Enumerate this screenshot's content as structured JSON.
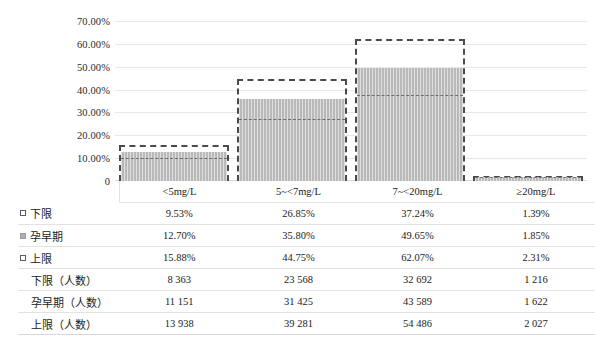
{
  "chart_data": {
    "type": "bar",
    "title": "",
    "xlabel": "",
    "ylabel": "",
    "ylim": [
      0,
      0.7
    ],
    "grid": true,
    "legend_position": "row-labels-left",
    "categories": [
      "<5mg/L",
      "5~<7mg/L",
      "7~<20mg/L",
      "≥20mg/L"
    ],
    "ytick_labels": [
      "70.00%",
      "60.00%",
      "50.00%",
      "40.00%",
      "30.00%",
      "20.00%",
      "10.00%",
      "0"
    ],
    "ytick_values": [
      0.7,
      0.6,
      0.5,
      0.4,
      0.3,
      0.2,
      0.1,
      0
    ],
    "series": [
      {
        "name": "下限",
        "marker": "dashed-square",
        "render": "inner-dashed-line",
        "values": [
          0.0953,
          0.2685,
          0.3724,
          0.0139
        ],
        "labels": [
          "9.53%",
          "26.85%",
          "37.24%",
          "1.39%"
        ]
      },
      {
        "name": "孕早期",
        "marker": "filled-square",
        "render": "gray-fill",
        "values": [
          0.127,
          0.358,
          0.4965,
          0.0185
        ],
        "labels": [
          "12.70%",
          "35.80%",
          "49.65%",
          "1.85%"
        ]
      },
      {
        "name": "上限",
        "marker": "dashed-square",
        "render": "dashed-outline",
        "values": [
          0.1588,
          0.4475,
          0.6207,
          0.0231
        ],
        "labels": [
          "15.88%",
          "44.75%",
          "62.07%",
          "2.31%"
        ]
      },
      {
        "name": "下限（人数）",
        "marker": "none",
        "render": "table-only",
        "values": [
          8363,
          23568,
          32692,
          1216
        ],
        "labels": [
          "8 363",
          "23 568",
          "32 692",
          "1 216"
        ]
      },
      {
        "name": "孕早期（人数）",
        "marker": "none",
        "render": "table-only",
        "values": [
          11151,
          31425,
          43589,
          1622
        ],
        "labels": [
          "11 151",
          "31 425",
          "43 589",
          "1 622"
        ]
      },
      {
        "name": "上限（人数）",
        "marker": "none",
        "render": "table-only",
        "values": [
          13938,
          39281,
          54486,
          2027
        ],
        "labels": [
          "13 938",
          "39 281",
          "54 486",
          "2 027"
        ]
      }
    ],
    "colors": {
      "bar_fill": "#b9b9b9",
      "bar_outline": "#4a4a4a",
      "inner_line": "#6d6d6d",
      "gridline": "#e8e8e8",
      "text": "#1b1b1b"
    }
  },
  "data_table": {
    "column_headers": [
      "",
      "<5mg/L",
      "5~<7mg/L",
      "7~<20mg/L",
      "≥20mg/L"
    ],
    "rows": [
      {
        "label": "下限",
        "marker": "dashed-square",
        "cells": [
          "9.53%",
          "26.85%",
          "37.24%",
          "1.39%"
        ]
      },
      {
        "label": "孕早期",
        "marker": "filled-square",
        "cells": [
          "12.70%",
          "35.80%",
          "49.65%",
          "1.85%"
        ]
      },
      {
        "label": "上限",
        "marker": "dashed-square",
        "cells": [
          "15.88%",
          "44.75%",
          "62.07%",
          "2.31%"
        ]
      },
      {
        "label": "下限（人数）",
        "marker": "none",
        "cells": [
          "8 363",
          "23 568",
          "32 692",
          "1 216"
        ]
      },
      {
        "label": "孕早期（人数）",
        "marker": "none",
        "cells": [
          "11 151",
          "31 425",
          "43 589",
          "1 622"
        ]
      },
      {
        "label": "上限（人数）",
        "marker": "none",
        "cells": [
          "13 938",
          "39 281",
          "54 486",
          "2 027"
        ]
      }
    ]
  }
}
